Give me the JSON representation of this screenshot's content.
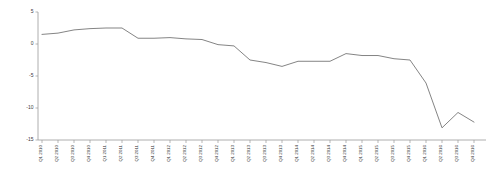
{
  "chart_data": {
    "type": "line",
    "title": "",
    "xlabel": "",
    "ylabel": "",
    "ylim": [
      -15,
      5
    ],
    "yticks": [
      5,
      0,
      -5,
      -10,
      -15
    ],
    "ytick_labels": [
      "5",
      "0",
      "-5",
      "-10",
      "-15"
    ],
    "grid": false,
    "legend": "none",
    "line_color": "#6e6e6e",
    "categories": [
      "Q1 2010",
      "Q2 2010",
      "Q3 2010",
      "Q4 2010",
      "Q1 2011",
      "Q2 2011",
      "Q3 2011",
      "Q4 2011",
      "Q1 2012",
      "Q2 2012",
      "Q3 2012",
      "Q4 2012",
      "Q1 2013",
      "Q2 2013",
      "Q3 2013",
      "Q4 2013",
      "Q1 2014",
      "Q2 2014",
      "Q3 2014",
      "Q4 2014",
      "Q1 2015",
      "Q2 2015",
      "Q3 2015",
      "Q4 2015",
      "Q1 2016",
      "Q2 2016",
      "Q3 2016",
      "Q4 2016"
    ],
    "xtick_labels": [
      "Q1 2010",
      "Q2 2010",
      "Q3 2010",
      "Q4 2010",
      "Q1 2011",
      "Q2 2011",
      "Q3 2011",
      "Q4 2011",
      "Q1 2012",
      "Q2 2012",
      "Q3 2012",
      "Q4 2012",
      "Q1 2013",
      "Q2 2013",
      "Q3 2013",
      "Q4 2013",
      "Q1 2014",
      "Q2 2014",
      "Q3 2014",
      "Q4 2014",
      "Q1 2015",
      "Q2 2015",
      "Q3 2015",
      "Q4 2015",
      "Q1 2016",
      "Q2 2016",
      "Q3 2016",
      "Q4 2016"
    ],
    "values": [
      1.5,
      1.7,
      2.2,
      2.4,
      2.5,
      2.5,
      0.9,
      0.9,
      1.0,
      0.8,
      0.7,
      -0.1,
      -0.3,
      -2.5,
      -2.9,
      -3.5,
      -2.7,
      -2.7,
      -2.7,
      -1.5,
      -1.8,
      -1.8,
      -2.3,
      -2.5,
      -6.1,
      -13.1,
      -10.7,
      -12.2
    ],
    "series": [
      {
        "name": "series-1",
        "values": [
          1.5,
          1.7,
          2.2,
          2.4,
          2.5,
          2.5,
          0.9,
          0.9,
          1.0,
          0.8,
          0.7,
          -0.1,
          -0.3,
          -2.5,
          -2.9,
          -3.5,
          -2.7,
          -2.7,
          -2.7,
          -1.5,
          -1.8,
          -1.8,
          -2.3,
          -2.5,
          -6.1,
          -13.1,
          -10.7,
          -12.2
        ]
      }
    ]
  }
}
